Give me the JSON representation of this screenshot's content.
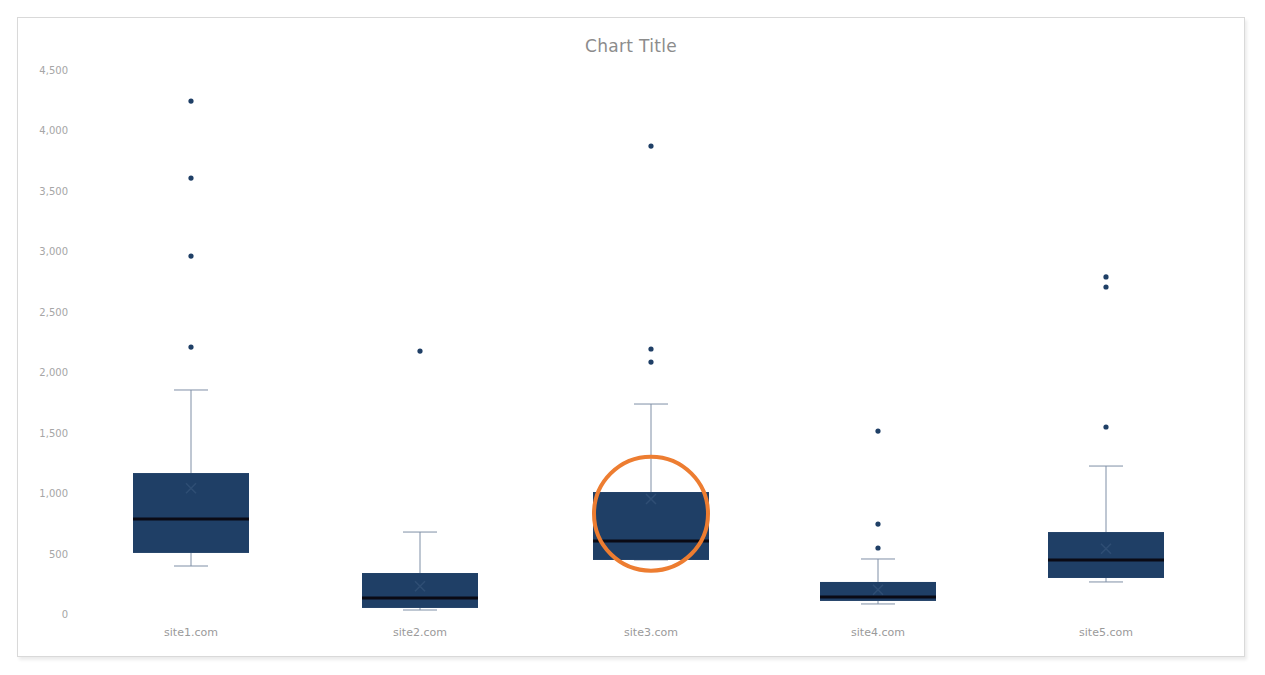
{
  "chart_data": {
    "type": "box",
    "title": "Chart Title",
    "xlabel": "",
    "ylabel": "",
    "ylim": [
      0,
      4500
    ],
    "yticks": [
      0,
      500,
      1000,
      1500,
      2000,
      2500,
      3000,
      3500,
      4000,
      4500
    ],
    "ytick_labels": [
      "0",
      "500",
      "1,000",
      "1,500",
      "2,000",
      "2,500",
      "3,000",
      "3,500",
      "4,000",
      "4,500"
    ],
    "grid": false,
    "legend": "none",
    "categories": [
      "site1.com",
      "site2.com",
      "site3.com",
      "site4.com",
      "site5.com"
    ],
    "series": [
      {
        "name": "site1.com",
        "whisker_low": 397,
        "q1": 505,
        "median": 786,
        "q3": 1166,
        "whisker_high": 1853,
        "mean": 1040,
        "outliers": [
          2208,
          2961,
          3606,
          4243
        ]
      },
      {
        "name": "site2.com",
        "whisker_low": 33,
        "q1": 50,
        "median": 132,
        "q3": 339,
        "whisker_high": 678,
        "mean": 230,
        "outliers": [
          2175
        ]
      },
      {
        "name": "site3.com",
        "whisker_low": 447,
        "q1": 447,
        "median": 604,
        "q3": 1009,
        "whisker_high": 1737,
        "mean": 951,
        "outliers": [
          2084,
          2192,
          3871
        ]
      },
      {
        "name": "site4.com",
        "whisker_low": 83,
        "q1": 108,
        "median": 141,
        "q3": 265,
        "whisker_high": 455,
        "mean": 200,
        "outliers": [
          546,
          744,
          1513
        ]
      },
      {
        "name": "site5.com",
        "whisker_low": 265,
        "q1": 298,
        "median": 447,
        "q3": 678,
        "whisker_high": 1224,
        "mean": 540,
        "outliers": [
          1547,
          2705,
          2788
        ]
      }
    ],
    "annotations": [
      {
        "type": "circle",
        "target": "site3.com",
        "color": "#ED7D31",
        "center_value": 830
      }
    ],
    "colors": {
      "box_fill": "#1F3F66",
      "median": "#0A0A14",
      "whisker": "#7F8FA6",
      "outlier": "#1F3F66",
      "axis_text": "#A6A6A6",
      "title": "#8C8C8C",
      "highlight": "#ED7D31"
    }
  }
}
